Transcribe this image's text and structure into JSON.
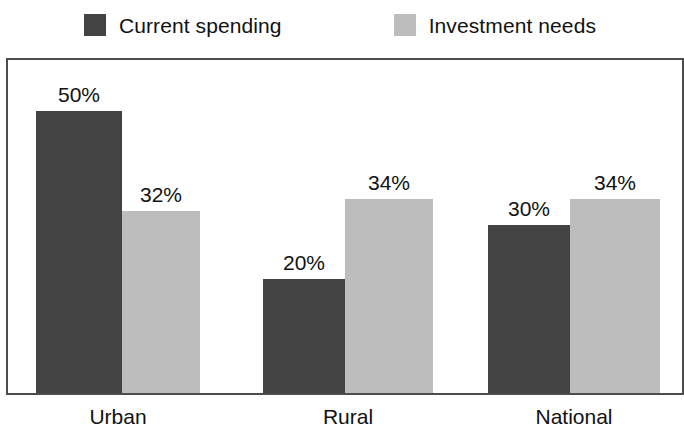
{
  "legend": {
    "position": "top-center",
    "entries": [
      {
        "label": "Current spending",
        "color": "#434343",
        "swatch_icon": "legend-swatch-square"
      },
      {
        "label": "Investment needs",
        "color": "#bdbdbd",
        "swatch_icon": "legend-swatch-square"
      }
    ]
  },
  "axis": {
    "categories": [
      "Urban",
      "Rural",
      "National"
    ]
  },
  "bars": [
    {
      "category": "Urban",
      "series": "Current spending",
      "value_label": "50%",
      "left": 30,
      "width": 86,
      "height": 282
    },
    {
      "category": "Urban",
      "series": "Investment needs",
      "value_label": "32%",
      "left": 116,
      "width": 78,
      "height": 182
    },
    {
      "category": "Rural",
      "series": "Current spending",
      "value_label": "20%",
      "left": 257,
      "width": 82,
      "height": 114
    },
    {
      "category": "Rural",
      "series": "Investment needs",
      "value_label": "34%",
      "left": 339,
      "width": 88,
      "height": 194
    },
    {
      "category": "National",
      "series": "Current spending",
      "value_label": "30%",
      "left": 482,
      "width": 82,
      "height": 168
    },
    {
      "category": "National",
      "series": "Investment needs",
      "value_label": "34%",
      "left": 564,
      "width": 90,
      "height": 194
    }
  ],
  "category_positions": [
    {
      "label": "Urban",
      "left": 36,
      "width": 164
    },
    {
      "label": "Rural",
      "left": 263,
      "width": 170
    },
    {
      "label": "National",
      "left": 488,
      "width": 172
    }
  ],
  "chart_data": {
    "type": "bar",
    "title": "",
    "subtitle": "",
    "xlabel": "",
    "ylabel": "",
    "categories": [
      "Urban",
      "Rural",
      "National"
    ],
    "series": [
      {
        "name": "Current spending",
        "color": "#434343",
        "values": [
          50,
          20,
          30
        ],
        "value_labels": [
          "50%",
          "20%",
          "30%"
        ]
      },
      {
        "name": "Investment needs",
        "color": "#bdbdbd",
        "values": [
          32,
          34,
          34
        ],
        "value_labels": [
          "32%",
          "34%",
          "34%"
        ]
      }
    ],
    "units": "percent",
    "ylim": [
      0,
      50
    ],
    "y_axis_visible": false,
    "y_ticks": [],
    "grid": false,
    "legend_position": "top-center",
    "data_labels": true,
    "frame": true,
    "frame_color": "#4d4d4d",
    "background": "#ffffff"
  }
}
